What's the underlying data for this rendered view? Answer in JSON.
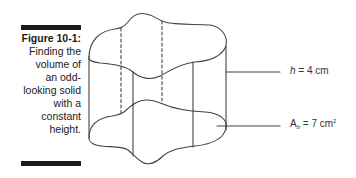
{
  "figure": {
    "number_label": "Figure 10-1:",
    "caption_lines": [
      "Finding the",
      "volume of",
      "an odd-",
      "looking solid",
      "with a",
      "constant",
      "height."
    ]
  },
  "labels": {
    "height": {
      "var": "h",
      "equals": " = 4 cm"
    },
    "base_area": {
      "var": "A",
      "subscript": "b",
      "equals": " = 7 cm",
      "superscript": "2"
    }
  },
  "colors": {
    "line": "#444444",
    "bar": "#1a1a1a",
    "text": "#333333"
  }
}
